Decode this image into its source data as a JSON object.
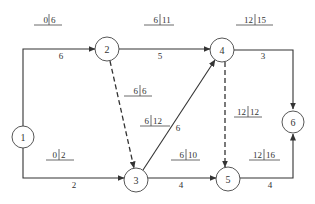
{
  "diagram": {
    "type": "activity-on-arrow network",
    "nodes": [
      {
        "id": "1",
        "label": "1"
      },
      {
        "id": "2",
        "label": "2"
      },
      {
        "id": "3",
        "label": "3"
      },
      {
        "id": "4",
        "label": "4"
      },
      {
        "id": "5",
        "label": "5"
      },
      {
        "id": "6",
        "label": "6"
      }
    ],
    "edges": [
      {
        "from": "1",
        "to": "2",
        "duration": "6",
        "es": "0",
        "ef": "6",
        "style": "solid"
      },
      {
        "from": "1",
        "to": "3",
        "duration": "2",
        "es": "0",
        "ef": "2",
        "style": "solid"
      },
      {
        "from": "2",
        "to": "4",
        "duration": "5",
        "es": "6",
        "ef": "11",
        "style": "solid"
      },
      {
        "from": "2",
        "to": "3",
        "duration": "",
        "es": "6",
        "ef": "6",
        "style": "dashed"
      },
      {
        "from": "3",
        "to": "4",
        "duration": "6",
        "es": "6",
        "ef": "12",
        "style": "solid"
      },
      {
        "from": "3",
        "to": "5",
        "duration": "4",
        "es": "6",
        "ef": "10",
        "style": "solid"
      },
      {
        "from": "4",
        "to": "5",
        "duration": "",
        "es": "12",
        "ef": "12",
        "style": "dashed"
      },
      {
        "from": "4",
        "to": "6",
        "duration": "3",
        "es": "12",
        "ef": "15",
        "style": "solid"
      },
      {
        "from": "5",
        "to": "6",
        "duration": "4",
        "es": "12",
        "ef": "16",
        "style": "solid"
      }
    ]
  }
}
